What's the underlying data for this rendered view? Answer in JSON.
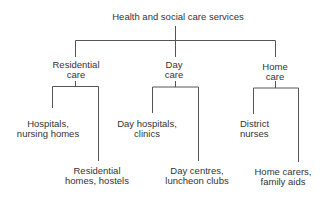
{
  "diagram": {
    "root": {
      "label": "Health and social care services"
    },
    "categories": [
      {
        "lines": [
          "Residential",
          "care"
        ],
        "children": [
          {
            "lines": [
              "Hospitals,",
              "nursing homes"
            ]
          },
          {
            "lines": [
              "Residential",
              "homes, hostels"
            ]
          }
        ]
      },
      {
        "lines": [
          "Day",
          "care"
        ],
        "children": [
          {
            "lines": [
              "Day hospitals,",
              "clinics"
            ]
          },
          {
            "lines": [
              "Day centres,",
              "luncheon clubs"
            ]
          }
        ]
      },
      {
        "lines": [
          "Home",
          "care"
        ],
        "children": [
          {
            "lines": [
              "District",
              "nurses"
            ]
          },
          {
            "lines": [
              "Home carers,",
              "family aids"
            ]
          }
        ]
      }
    ],
    "line_color": "#555555",
    "text_color": "#333333"
  }
}
